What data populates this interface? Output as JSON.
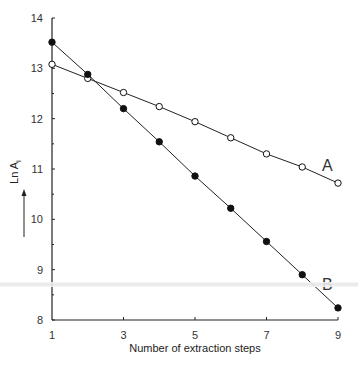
{
  "chart_data": {
    "type": "line",
    "title": "",
    "xlabel": "Number of extraction steps",
    "ylabel": "Ln A",
    "ylabel_subscript": "i",
    "xlim": [
      1,
      9
    ],
    "ylim": [
      8,
      14
    ],
    "x_ticks": [
      1,
      3,
      5,
      7,
      9
    ],
    "x_tick_labels": [
      "1",
      "3",
      "5",
      "7",
      "9"
    ],
    "x_minor_ticks": [
      1,
      2,
      3,
      4,
      5,
      6,
      7,
      8,
      9
    ],
    "y_ticks": [
      8,
      9,
      10,
      11,
      12,
      13,
      14
    ],
    "y_tick_labels": [
      "8",
      "9",
      "10",
      "11",
      "12",
      "13",
      "14"
    ],
    "grid": false,
    "x": [
      1,
      2,
      3,
      4,
      5,
      6,
      7,
      8,
      9
    ],
    "series": [
      {
        "name": "A",
        "marker": "open-circle",
        "values": [
          13.08,
          12.8,
          12.52,
          12.24,
          11.94,
          11.62,
          11.3,
          11.04,
          10.72
        ]
      },
      {
        "name": "B",
        "marker": "filled-circle",
        "values": [
          13.52,
          12.88,
          12.2,
          11.54,
          10.86,
          10.22,
          9.56,
          8.9,
          8.24
        ]
      }
    ],
    "annotations": [
      {
        "text": "A",
        "near_series": "A",
        "position": "above-right end"
      },
      {
        "text": "B",
        "near_series": "B",
        "position": "above-right end"
      },
      {
        "text": "↑",
        "meaning": "increasing arrow beside y-axis label"
      }
    ],
    "colors": {
      "line": "#222222",
      "marker": "#111111",
      "background": "#ffffff"
    }
  },
  "caption_partial": "Figure caption (cut off)"
}
